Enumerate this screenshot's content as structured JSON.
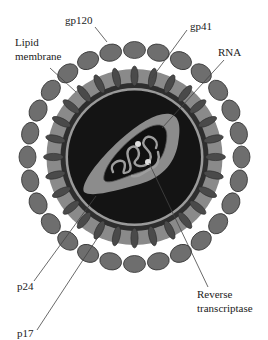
{
  "labels": {
    "gp120": "gp120",
    "gp41": "gp41",
    "lipid_1": "Lipid",
    "lipid_2": "membrane",
    "rna": "RNA",
    "p24": "p24",
    "p17": "p17",
    "rt_1": "Reverse",
    "rt_2": "transcriptase"
  },
  "colors": {
    "knob_fill": "#6e6e6e",
    "knob_stroke": "#333333",
    "stalk_fill": "#4a4a4a",
    "shell_band": "#8a8a8a",
    "matrix_ring": "#2e2e2e",
    "core_ring": "#9a9a9a",
    "interior": "#141414",
    "capsid": "#8c8c8c",
    "rna": "#9e9e9e",
    "enzyme_dot": "#dddddd",
    "leader_line": "#444444"
  },
  "geometry": {
    "center": [
      134.5,
      157
    ],
    "knob_ring_radius": 107,
    "knob_count": 28
  }
}
